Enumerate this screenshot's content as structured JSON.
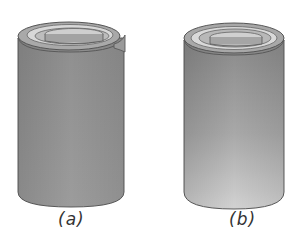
{
  "figure": {
    "panels": [
      {
        "id": "a",
        "label": "(a)",
        "description": "rolled sheet cylinder with open overlapping edge",
        "body_color_top": "#8f8f8f",
        "body_color_bottom": "#9a9a9a"
      },
      {
        "id": "b",
        "label": "(b)",
        "description": "closed concentric cylinder with lighter gradient",
        "body_color_top": "#8c8c8c",
        "body_color_bottom": "#cfcfcf"
      }
    ],
    "colors": {
      "outline": "#555555",
      "top_light": "#d6d6d6",
      "top_mid": "#b4b4b4",
      "background": "#ffffff"
    }
  }
}
